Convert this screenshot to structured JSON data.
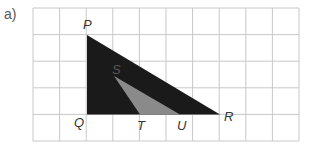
{
  "question": {
    "label": "a)"
  },
  "grid": {
    "cols": 10,
    "rows": 5,
    "x0": 33,
    "y0": 8,
    "cell": 26.6,
    "line_color": "#c8c8c8"
  },
  "shapes": {
    "outer_triangle": {
      "name": "PQR",
      "color": "#1a1a1a"
    },
    "inner_triangle": {
      "name": "STU",
      "color": "#8a8a8a"
    }
  },
  "points": {
    "P": "P",
    "Q": "Q",
    "R": "R",
    "S": "S",
    "T": "T",
    "U": "U"
  }
}
